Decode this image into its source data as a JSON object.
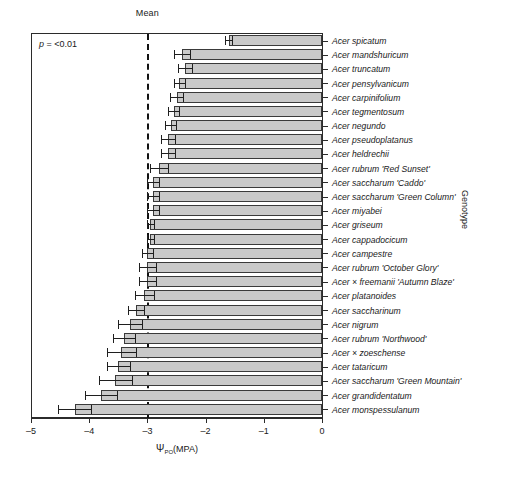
{
  "figure": {
    "mean_label": "Mean",
    "pvalue_text_italic": "p",
    "pvalue_text_rest": " = <0.01",
    "x_axis_title_prefix": "Ψ",
    "x_axis_title_sub": "PO",
    "x_axis_title_suffix": "(MPA)",
    "y_axis_title": "Genotype"
  },
  "chart_data": {
    "type": "bar",
    "orientation": "horizontal",
    "title": "",
    "xlabel": "ΨPO(MPA)",
    "ylabel": "Genotype",
    "xlim": [
      -5,
      0
    ],
    "xticks": [
      -5,
      -4,
      -3,
      -2,
      -1,
      0
    ],
    "xtick_labels": [
      "–5",
      "–4",
      "–3",
      "–2",
      "–1",
      "0"
    ],
    "grid": false,
    "legend": false,
    "annotations": [
      {
        "text": "Mean",
        "type": "reference-line-label",
        "x": -3
      },
      {
        "text": "p = <0.01",
        "type": "statistic",
        "position": "top-left"
      }
    ],
    "reference_line": {
      "x": -3,
      "style": "dashed",
      "label": "Mean"
    },
    "bar_baseline": 0,
    "categories": [
      "Acer spicatum",
      "Acer mandshuricum",
      "Acer truncatum",
      "Acer pensylvanicum",
      "Acer carpinifolium",
      "Acer tegmentosum",
      "Acer negundo",
      "Acer pseudoplatanus",
      "Acer heldrechii",
      "Acer rubrum 'Red Sunset'",
      "Acer saccharum 'Caddo'",
      "Acer saccharum 'Green Column'",
      "Acer miyabei",
      "Acer griseum",
      "Acer cappadocicum",
      "Acer campestre",
      "Acer rubrum 'October Glory'",
      "Acer × freemanii 'Autumn Blaze'",
      "Acer platanoides",
      "Acer saccharinum",
      "Acer nigrum",
      "Acer rubrum 'Northwood'",
      "Acer × zoeschense",
      "Acer tataricum",
      "Acer saccharum 'Green Mountain'",
      "Acer grandidentatum",
      "Acer monspessulanum"
    ],
    "values": [
      -1.6,
      -2.4,
      -2.35,
      -2.45,
      -2.5,
      -2.55,
      -2.6,
      -2.65,
      -2.65,
      -2.8,
      -2.9,
      -2.9,
      -2.9,
      -2.95,
      -2.95,
      -3.0,
      -3.0,
      -3.0,
      -3.05,
      -3.2,
      -3.3,
      -3.4,
      -3.45,
      -3.5,
      -3.55,
      -3.8,
      -4.25
    ],
    "errors": [
      0.06,
      0.14,
      0.12,
      0.1,
      0.11,
      0.1,
      0.09,
      0.12,
      0.12,
      0.16,
      0.1,
      0.1,
      0.1,
      0.06,
      0.06,
      0.1,
      0.14,
      0.14,
      0.17,
      0.14,
      0.2,
      0.19,
      0.25,
      0.2,
      0.28,
      0.28,
      0.28
    ],
    "bar_color": "#c9c9c9",
    "bar_edge_color": "#3a3a3a",
    "error_color": "#1f1f1f"
  }
}
